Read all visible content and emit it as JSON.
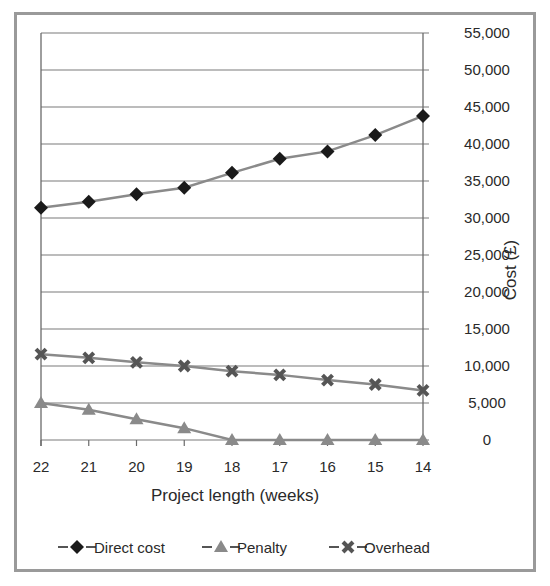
{
  "chart_data": {
    "type": "line",
    "title": "",
    "xlabel": "Project length (weeks)",
    "ylabel": "Cost (£)",
    "categories": [
      "22",
      "21",
      "20",
      "19",
      "18",
      "17",
      "16",
      "15",
      "14"
    ],
    "ylim": [
      0,
      55000
    ],
    "yticks": [
      0,
      5000,
      10000,
      15000,
      20000,
      25000,
      30000,
      35000,
      40000,
      45000,
      50000,
      55000
    ],
    "ytick_labels": [
      "0",
      "5,000",
      "10,000",
      "15,000",
      "20,000",
      "25,000",
      "30,000",
      "35,000",
      "40,000",
      "45,000",
      "50,000",
      "55,000"
    ],
    "grid": true,
    "legend_position": "bottom",
    "series": [
      {
        "name": "Direct cost",
        "marker": "diamond",
        "marker_color": "#1a1a1a",
        "line_color": "#8a8a8a",
        "values": [
          31400,
          32200,
          33200,
          34100,
          36100,
          38000,
          39000,
          41200,
          43800
        ]
      },
      {
        "name": "Penalty",
        "marker": "triangle",
        "marker_color": "#8a8a8a",
        "line_color": "#8a8a8a",
        "values": [
          5000,
          4100,
          2800,
          1600,
          0,
          0,
          0,
          0,
          0
        ]
      },
      {
        "name": "Overhead",
        "marker": "x",
        "marker_color": "#555555",
        "line_color": "#8a8a8a",
        "values": [
          11600,
          11100,
          10500,
          10000,
          9300,
          8800,
          8100,
          7500,
          6700
        ]
      }
    ]
  }
}
